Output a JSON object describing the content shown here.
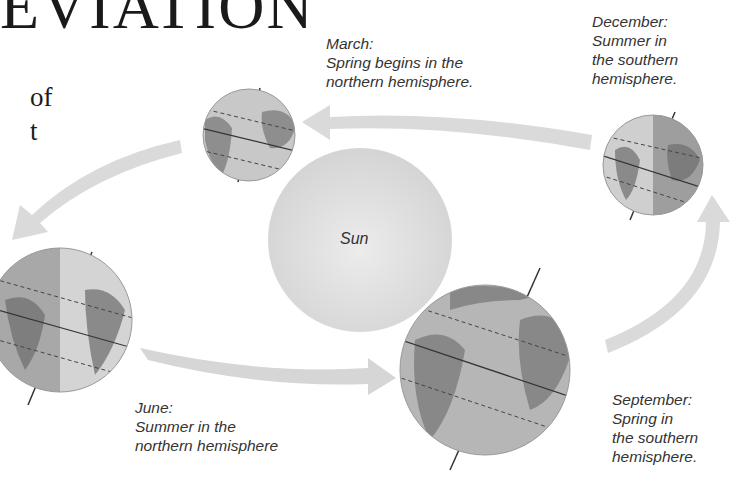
{
  "title": {
    "top_fragment": "EVIATION",
    "line2_fragment": "of",
    "line3_fragment": "t"
  },
  "sun": {
    "label": "Sun",
    "color": "#dcdcdc"
  },
  "orbit_positions": [
    {
      "month": "March",
      "label": "March:\nSpring begins in the\nnorthern hemisphere."
    },
    {
      "month": "December",
      "label": "December:\nSummer in\nthe southern\nhemisphere."
    },
    {
      "month": "June",
      "label": "June:\nSummer in the\nnorthern hemisphere"
    },
    {
      "month": "September",
      "label": "September:\nSpring in\nthe southern\nhemisphere."
    }
  ],
  "colors": {
    "arrow": "#d8d8d8",
    "ocean": "#b9b9b9",
    "land": "#8a8a8a",
    "night_shade": "#9a9a9a",
    "text": "#333333"
  }
}
